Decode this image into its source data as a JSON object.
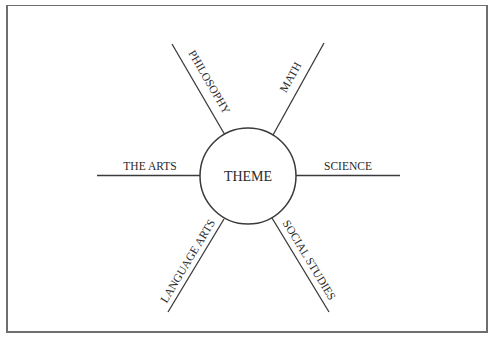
{
  "diagram": {
    "type": "web-organizer",
    "center": {
      "label": "THEME"
    },
    "spokes": [
      {
        "id": "philosophy",
        "label": "PHILOSOPHY",
        "position": "upper-left"
      },
      {
        "id": "math",
        "label": "MATH",
        "position": "upper-right"
      },
      {
        "id": "the-arts",
        "label": "THE ARTS",
        "position": "left"
      },
      {
        "id": "science",
        "label": "SCIENCE",
        "position": "right"
      },
      {
        "id": "language-arts",
        "label": "LANGUAGE ARTS",
        "position": "lower-left"
      },
      {
        "id": "social-studies",
        "label": "SOCIAL STUDIES",
        "position": "lower-right"
      }
    ],
    "colors": {
      "line": "#3a3a3a",
      "text": "#2a2a2a",
      "frame": "#6e6e6e",
      "background": "#ffffff"
    }
  }
}
